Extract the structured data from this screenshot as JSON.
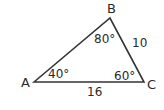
{
  "figure": {
    "type": "triangle",
    "stroke_color": "#333333",
    "background": "#ffffff",
    "vertices": {
      "A": {
        "label": "A",
        "x": 34,
        "y": 82
      },
      "B": {
        "label": "B",
        "x": 110,
        "y": 18
      },
      "C": {
        "label": "C",
        "x": 144,
        "y": 82
      }
    },
    "angles": {
      "A": "40°",
      "B": "80°",
      "C": "60°"
    },
    "sides": {
      "BC": "10",
      "AC": "16"
    }
  }
}
